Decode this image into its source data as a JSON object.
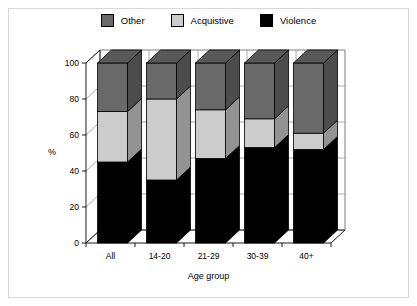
{
  "chart_data": {
    "type": "bar",
    "stacked": true,
    "three_d": true,
    "title": "",
    "xlabel": "Age group",
    "ylabel": "%",
    "ylim": [
      0,
      100
    ],
    "yticks": [
      0,
      20,
      40,
      60,
      80,
      100
    ],
    "grid": true,
    "legend_position": "top-center",
    "categories": [
      "All",
      "14-20",
      "21-29",
      "30-39",
      "40+"
    ],
    "series": [
      {
        "name": "Violence",
        "color": "#000000",
        "values": [
          45,
          35,
          47,
          53,
          52
        ]
      },
      {
        "name": "Acquistive",
        "color": "#cccccc",
        "values": [
          28,
          45,
          27,
          16,
          9
        ]
      },
      {
        "name": "Other",
        "color": "#696969",
        "values": [
          27,
          20,
          26,
          31,
          39
        ]
      }
    ],
    "cumulative_tops": {
      "violence": [
        45,
        35,
        47,
        53,
        52
      ],
      "acquistive": [
        73,
        80,
        74,
        69,
        61
      ],
      "other": [
        100,
        100,
        100,
        100,
        100
      ]
    }
  },
  "legend": {
    "entries": [
      {
        "label": "Other",
        "color": "#696969"
      },
      {
        "label": "Acquistive",
        "color": "#cccccc"
      },
      {
        "label": "Violence",
        "color": "#000000"
      }
    ]
  },
  "axes": {
    "y_title": "%",
    "x_title": "Age group",
    "y_tick_labels": [
      "0",
      "20",
      "40",
      "60",
      "80",
      "100"
    ],
    "x_tick_labels": [
      "All",
      "14-20",
      "21-29",
      "30-39",
      "40+"
    ]
  }
}
